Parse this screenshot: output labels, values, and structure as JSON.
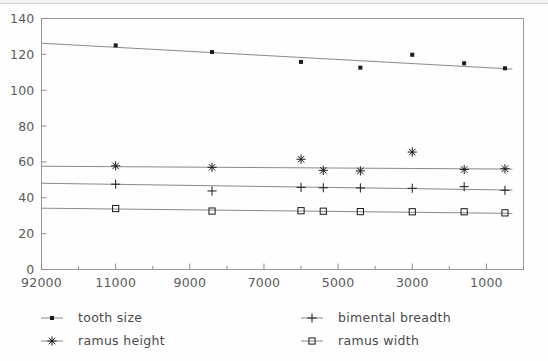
{
  "chart_data": {
    "type": "scatter",
    "title": "",
    "subtitle": "",
    "xlabel": "",
    "ylabel": "",
    "grid": false,
    "legend_position": "bottom",
    "x_axis": {
      "tick_labels": [
        "92000",
        "11000",
        "9000",
        "7000",
        "5000",
        "3000",
        "1000"
      ],
      "tick_values": [
        13000,
        11000,
        9000,
        7000,
        5000,
        3000,
        1000
      ],
      "minor_ticks_per_interval": 2,
      "reversed": true,
      "range": [
        13000,
        0
      ]
    },
    "y_axis": {
      "tick_labels": [
        "0",
        "20",
        "40",
        "60",
        "80",
        "100",
        "120",
        "140"
      ],
      "tick_values": [
        0,
        20,
        40,
        60,
        80,
        100,
        120,
        140
      ],
      "ylim": [
        0,
        140
      ]
    },
    "series": [
      {
        "name": "tooth size",
        "marker": "filled-square",
        "x": [
          11000,
          8400,
          6000,
          4400,
          3000,
          1600,
          500
        ],
        "values": [
          125.0,
          121.3,
          115.8,
          112.6,
          119.8,
          115.0,
          112.2
        ],
        "trend_start": [
          13000,
          126.2
        ],
        "trend_end": [
          300,
          111.8
        ]
      },
      {
        "name": "ramus height",
        "marker": "asterisk",
        "x": [
          11000,
          8400,
          6000,
          5400,
          4400,
          3000,
          1600,
          500
        ],
        "values": [
          57.8,
          57.0,
          61.5,
          55.3,
          55.0,
          65.5,
          55.8,
          56.2
        ],
        "trend_start": [
          13000,
          57.6
        ],
        "trend_end": [
          300,
          56.0
        ]
      },
      {
        "name": "bimental breadth",
        "marker": "plus",
        "x": [
          11000,
          8400,
          6000,
          5400,
          4400,
          3000,
          1600,
          500
        ],
        "values": [
          47.6,
          43.8,
          45.8,
          45.6,
          45.5,
          45.3,
          46.2,
          44.2
        ],
        "trend_start": [
          13000,
          48.1
        ],
        "trend_end": [
          300,
          44.3
        ]
      },
      {
        "name": "ramus width",
        "marker": "open-square",
        "x": [
          11000,
          8400,
          6000,
          5400,
          4400,
          3000,
          1600,
          500
        ],
        "values": [
          34.0,
          32.6,
          32.8,
          32.5,
          32.3,
          32.2,
          32.2,
          31.6
        ],
        "trend_start": [
          13000,
          34.2
        ],
        "trend_end": [
          300,
          31.3
        ]
      }
    ]
  },
  "legend": {
    "entries": [
      {
        "label": "tooth size",
        "marker": "filled-square"
      },
      {
        "label": "bimental breadth",
        "marker": "plus"
      },
      {
        "label": "ramus height",
        "marker": "asterisk"
      },
      {
        "label": "ramus width",
        "marker": "open-square"
      }
    ]
  },
  "colors": {
    "background": "#fefefe",
    "frame": "#9a9a9a",
    "trend_line": "#8a8a8a",
    "marker": "#1a1a1a",
    "tick_label": "#5a5a5a",
    "legend_label": "#4a4a4a"
  }
}
